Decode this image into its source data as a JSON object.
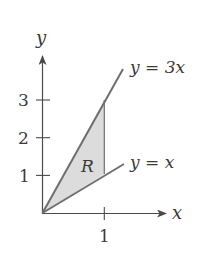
{
  "diagram": {
    "type": "region-plot",
    "axes": {
      "x_label": "x",
      "y_label": "y",
      "x_ticks": [
        {
          "value": 1,
          "label": "1"
        }
      ],
      "y_ticks": [
        {
          "value": 1,
          "label": "1"
        },
        {
          "value": 2,
          "label": "2"
        },
        {
          "value": 3,
          "label": "3"
        }
      ]
    },
    "curves": [
      {
        "name": "upper",
        "label": "y = 3x",
        "slope": 3
      },
      {
        "name": "lower",
        "label": "y = x",
        "slope": 1
      }
    ],
    "region": {
      "label": "R",
      "bounds": "between y = x and y = 3x for 0 ≤ x ≤ 1",
      "fill": "#dcdcdc"
    },
    "colors": {
      "axis": "#4a4a4a",
      "curve": "#6e6e6e",
      "region_fill": "#dcdcdc",
      "text": "#3a3a3a"
    }
  }
}
